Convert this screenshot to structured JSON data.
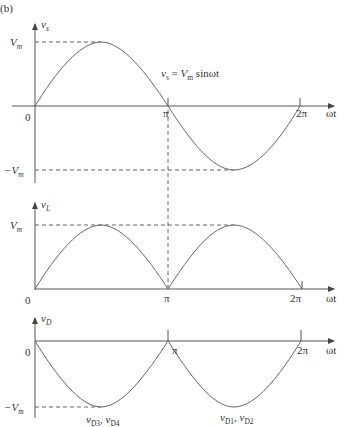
{
  "figure_label": "(b)",
  "panels": [
    {
      "name": "source-voltage",
      "y_label": "v",
      "y_label_sub": "s",
      "peak_label": "V",
      "peak_label_sub": "m",
      "neg_peak_label": "−V",
      "neg_peak_label_sub": "m",
      "origin_label": "0",
      "x_ticks": [
        "π",
        "2π"
      ],
      "x_label": "ωt",
      "equation": {
        "lhs": "v",
        "lhs_sub": "s",
        "eq": " = ",
        "rhs": "V",
        "rhs_sub": "m",
        "fn": " sinωt"
      }
    },
    {
      "name": "load-voltage",
      "y_label": "v",
      "y_label_sub": "L",
      "peak_label": "V",
      "peak_label_sub": "m",
      "origin_label": "0",
      "x_ticks": [
        "π",
        "2π"
      ],
      "x_label": "ωt"
    },
    {
      "name": "diode-voltage",
      "y_label": "v",
      "y_label_sub": "D",
      "neg_peak_label": "−V",
      "neg_peak_label_sub": "m",
      "origin_label": "0",
      "x_ticks": [
        "π",
        "2π"
      ],
      "x_label": "ωt",
      "annotations": [
        {
          "a": "v",
          "a_sub": "D3",
          "sep": ", ",
          "b": "v",
          "b_sub": "D4"
        },
        {
          "a": "v",
          "a_sub": "D1",
          "sep": ", ",
          "b": "v",
          "b_sub": "D2"
        }
      ]
    }
  ],
  "colors": {
    "axis": "#555555",
    "curve": "#666666",
    "text": "#333333"
  }
}
